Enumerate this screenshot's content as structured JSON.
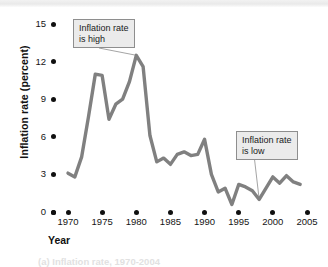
{
  "chart_data": {
    "type": "line",
    "title": "",
    "xlabel": "Year",
    "ylabel": "Inflation rate (percent)",
    "xlim": [
      1968,
      2005
    ],
    "ylim": [
      0,
      15
    ],
    "grid": false,
    "legend": "none",
    "xticks": [
      "1970",
      "1975",
      "1980",
      "1985",
      "1990",
      "1995",
      "2000",
      "2005"
    ],
    "xtick_values": [
      1970,
      1975,
      1980,
      1985,
      1990,
      1995,
      2000,
      2005
    ],
    "yticks": [
      "0",
      "3",
      "6",
      "9",
      "12",
      "15"
    ],
    "ytick_values": [
      0,
      3,
      6,
      9,
      12,
      15
    ],
    "line_color": "#808080",
    "series": [
      {
        "name": "Inflation rate",
        "x": [
          1970,
          1971,
          1972,
          1973,
          1974,
          1975,
          1976,
          1977,
          1978,
          1979,
          1980,
          1981,
          1982,
          1983,
          1984,
          1985,
          1986,
          1987,
          1988,
          1989,
          1990,
          1991,
          1992,
          1993,
          1994,
          1995,
          1996,
          1997,
          1998,
          1999,
          2000,
          2001,
          2002,
          2003,
          2004
        ],
        "values": [
          3.1,
          2.8,
          4.4,
          7.6,
          11.0,
          10.9,
          7.4,
          8.6,
          9.0,
          10.4,
          12.5,
          11.6,
          6.1,
          4.0,
          4.3,
          3.8,
          4.6,
          4.8,
          4.5,
          4.6,
          5.8,
          3.0,
          1.6,
          1.9,
          0.6,
          2.2,
          2.0,
          1.7,
          1.0,
          1.9,
          2.8,
          2.3,
          2.9,
          2.4,
          2.2
        ]
      }
    ],
    "annotations": [
      {
        "id": "callout-high",
        "text": "Inflation rate\nis high",
        "points_to_year": 1980,
        "points_to_value": 12.5
      },
      {
        "id": "callout-low",
        "text": "Inflation rate\nis low",
        "points_to_year": 1998,
        "points_to_value": 1.0
      }
    ]
  },
  "footer": {
    "clipped_caption": "(a) Inflation rate, 1970-2004"
  }
}
